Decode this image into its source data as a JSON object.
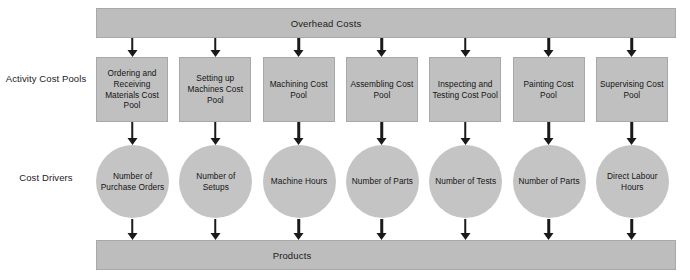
{
  "diagram": {
    "title_bar": {
      "label": "Overhead Costs"
    },
    "bottom_bar": {
      "label": "Products"
    },
    "row_labels": {
      "activity_cost_pools": "Activity Cost Pools",
      "cost_drivers": "Cost Drivers"
    },
    "colors": {
      "bar_fill": "#bdbdbd",
      "box_fill": "#c0c0c0",
      "oval_fill": "#c4c4c4",
      "arrow": "#1a1a1a",
      "text": "#141414",
      "background": "#ffffff"
    },
    "columns": [
      {
        "cost_pool": "Ordering and Receiving Materials Cost Pool",
        "cost_driver": "Number of Purchase Orders"
      },
      {
        "cost_pool": "Setting up Machines Cost Pool",
        "cost_driver": "Number of Setups"
      },
      {
        "cost_pool": "Machining Cost Pool",
        "cost_driver": "Machine Hours"
      },
      {
        "cost_pool": "Assembling Cost Pool",
        "cost_driver": "Number of Parts"
      },
      {
        "cost_pool": "Inspecting and Testing Cost Pool",
        "cost_driver": "Number of Tests"
      },
      {
        "cost_pool": "Painting Cost Pool",
        "cost_driver": "Number of Parts"
      },
      {
        "cost_pool": "Supervising Cost Pool",
        "cost_driver": "Direct Labour Hours"
      }
    ]
  }
}
